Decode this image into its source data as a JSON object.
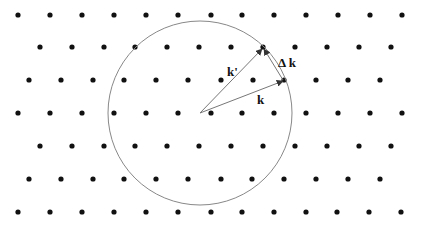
{
  "diagram": {
    "type": "ewald-sphere-reciprocal-lattice",
    "colors": {
      "dot": "#111111",
      "circle": "#888888",
      "vector": "#777777",
      "label": "#111111"
    },
    "lattice": {
      "dot_radius": 2.6,
      "rows": [
        {
          "y": 15,
          "xs": [
            18,
            50,
            82,
            114,
            146,
            178,
            211,
            242,
            274,
            306,
            338,
            370,
            402
          ]
        },
        {
          "y": 47,
          "xs": [
            40,
            72,
            104,
            135,
            167,
            199,
            231,
            263,
            295,
            327,
            359,
            391
          ]
        },
        {
          "y": 80,
          "xs": [
            29,
            61,
            93,
            124,
            156,
            188,
            221,
            253,
            284,
            316,
            348,
            380
          ]
        },
        {
          "y": 113,
          "xs": [
            18,
            50,
            82,
            114,
            146,
            178,
            211,
            242,
            274,
            306,
            338,
            370,
            402
          ]
        },
        {
          "y": 146,
          "xs": [
            40,
            72,
            104,
            135,
            167,
            199,
            231,
            263,
            295,
            327,
            359,
            391
          ]
        },
        {
          "y": 179,
          "xs": [
            29,
            61,
            93,
            124,
            156,
            188,
            221,
            252,
            284,
            316,
            348,
            380
          ]
        },
        {
          "y": 212,
          "xs": [
            18,
            50,
            82,
            114,
            146,
            178,
            211,
            242,
            274,
            306,
            337,
            369,
            401
          ]
        }
      ]
    },
    "circle": {
      "cx": 200,
      "cy": 113,
      "r": 92
    },
    "vectors": [
      {
        "name": "k",
        "x1": 200,
        "y1": 113,
        "x2": 283,
        "y2": 81
      },
      {
        "name": "k-prime",
        "x1": 200,
        "y1": 113,
        "x2": 262,
        "y2": 49
      },
      {
        "name": "delta-k",
        "x1": 283,
        "y1": 80,
        "x2": 264,
        "y2": 49
      }
    ],
    "labels": {
      "k": {
        "text": "k",
        "x": 257,
        "y": 104
      },
      "k_prime": {
        "text": "k'",
        "x": 227,
        "y": 76
      },
      "delta_k": {
        "text": "Δ k",
        "x": 278,
        "y": 67
      }
    }
  }
}
